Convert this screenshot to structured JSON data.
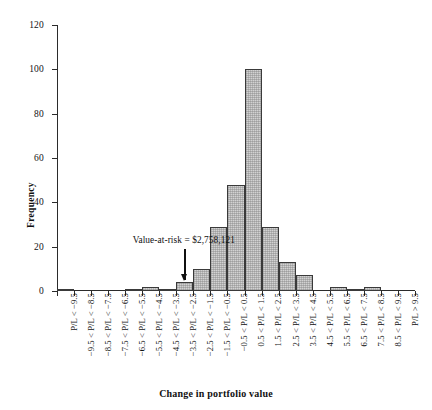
{
  "chart_data": {
    "type": "bar",
    "title": "",
    "xlabel": "Change in portfolio value",
    "ylabel": "Frequency",
    "ylim": [
      0,
      120
    ],
    "yticks": [
      0,
      20,
      40,
      60,
      80,
      100,
      120
    ],
    "grid": false,
    "legend": null,
    "categories": [
      "P/L < −9.5",
      "−9.5 < P/L < −8.5",
      "−8.5 < P/L < −7.5",
      "−7.5 < P/L < −6.5",
      "−6.5 < P/L < −5.5",
      "−5.5 < P/L < −4.5",
      "−4.5 < P/L < −3.5",
      "−3.5 < P/L < −2.5",
      "−2.5 < P/L < −1.5",
      "−1.5 < P/L < −0.5",
      "−0.5 < P/L < 0.5",
      "0.5 < P/L < 1.5",
      "1.5 < P/L < 2.5",
      "2.5 < P/L < 3.5",
      "3.5 < P/L < 4.5",
      "4.5 < P/L < 5.5",
      "5.5 < P/L < 6.5",
      "6.5 < P/L < 7.5",
      "7.5 < P/L < 8.5",
      "8.5 < P/L < 9.5",
      "P/L > 9.5"
    ],
    "values": [
      1,
      0,
      0,
      0,
      1,
      2,
      1,
      4,
      10,
      29,
      48,
      100,
      29,
      13,
      7,
      0,
      2,
      1,
      2,
      0,
      0
    ],
    "annotations": [
      {
        "text": "Value-at-risk = $2,758,121",
        "points_to_category": "−3.5 < P/L < −2.5",
        "arrow": true
      }
    ],
    "bar_fill_color": "#d2d2d2",
    "bar_edge_color": "#3a3a3a",
    "axis_color": "#2b2b2b"
  }
}
